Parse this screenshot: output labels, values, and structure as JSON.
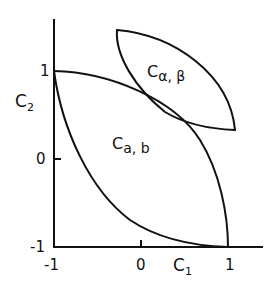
{
  "figure": {
    "type": "diagram",
    "axes": {
      "x": {
        "label_main": "C",
        "label_sub": "1",
        "ticks": [
          "-1",
          "0",
          "1"
        ]
      },
      "y": {
        "label_main": "C",
        "label_sub": "2",
        "ticks": [
          "1",
          "0",
          "-1"
        ]
      }
    },
    "regions": [
      {
        "id": "lower",
        "label_main": "C",
        "label_sub": "a, b",
        "description": "Lens-shaped region spanning from (-1, 1) to (1, -1)"
      },
      {
        "id": "upper",
        "label_main": "C",
        "label_sub": "α, β",
        "description": "Lens-shaped region above, tangent to the lower region"
      }
    ],
    "stroke_color": "#111111",
    "background_color": "#ffffff"
  }
}
